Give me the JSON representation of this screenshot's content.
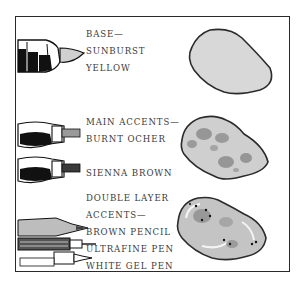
{
  "swatches": [
    {
      "id": "base",
      "lines": [
        "BASE—",
        "SUNBURST",
        "YELLOW"
      ],
      "tool_icons": [
        "marker-icon"
      ],
      "fill": "#d8d8d8",
      "outline": "#2b2b2b"
    },
    {
      "id": "main-accents",
      "lines": [
        "MAIN ACCENTS—",
        "BURNT OCHER",
        "",
        "SIENNA BROWN"
      ],
      "tool_icons": [
        "marker-icon",
        "marker-icon"
      ],
      "fill": "#cfcfcf",
      "spots": "#8c8c8c",
      "outline": "#2b2b2b"
    },
    {
      "id": "double-layer",
      "lines": [
        "DOUBLE LAYER",
        "ACCENTS—",
        "BROWN PENCIL",
        "ULTRAFINE PEN",
        "WHITE GEL PEN"
      ],
      "tool_icons": [
        "pencil-icon",
        "fineliner-pen-icon",
        "gel-pen-icon"
      ],
      "fill": "#c4c4c4",
      "highlight": "#f4f4f4",
      "outline": "#2b2b2b"
    }
  ]
}
